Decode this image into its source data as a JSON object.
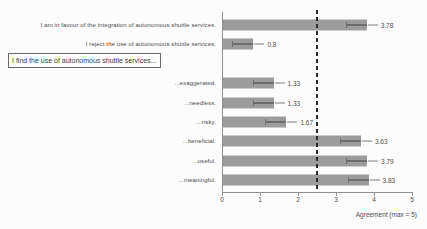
{
  "chart_data": {
    "type": "bar",
    "orientation": "horizontal",
    "xlabel": "Agreement (max = 5)",
    "xlim": [
      0,
      5
    ],
    "xticks": [
      "0",
      "1",
      "2",
      "3",
      "4",
      "5"
    ],
    "reference_line_x": 2.5,
    "grid": false,
    "error_bars": true,
    "group_header": "I find the use of autonomous shuttle services...",
    "rows": [
      {
        "label": "I am in favour of the integration of autonomous shuttle services.",
        "value": 3.78,
        "display": "3.78"
      },
      {
        "label": "I reject the use of autonomous shuttle services.",
        "value": 0.8,
        "display": "0.8"
      },
      {
        "header": true
      },
      {
        "label": "...exaggerated.",
        "value": 1.33,
        "display": "1.33"
      },
      {
        "label": "...needless.",
        "value": 1.33,
        "display": "1.33"
      },
      {
        "label": "...risky.",
        "value": 1.67,
        "display": "1.67"
      },
      {
        "label": "...beneficial.",
        "value": 3.63,
        "display": "3.63"
      },
      {
        "label": "...useful.",
        "value": 3.79,
        "display": "3.79"
      },
      {
        "label": "...meaningful.",
        "value": 3.83,
        "display": "3.83"
      }
    ],
    "colors": {
      "bar": "#9c9c9c",
      "whisker": "#6d6d6d",
      "axis": "#8f8f8f",
      "text": "#4d4d4d",
      "reference_line": "#2a2a2a",
      "background": "#fcfcfc"
    }
  }
}
